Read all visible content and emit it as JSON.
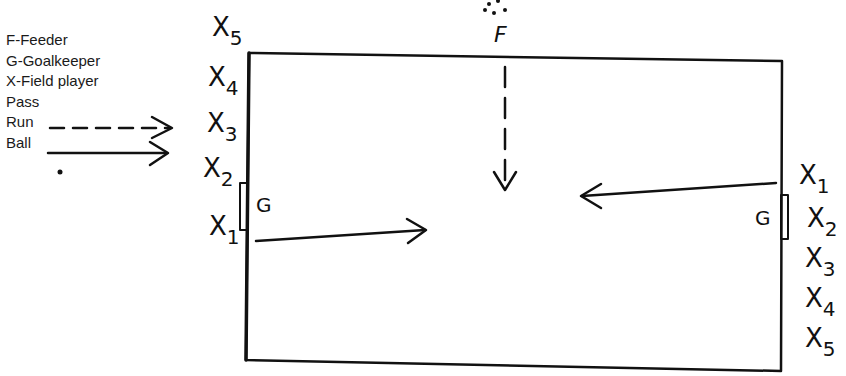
{
  "legend": {
    "feeder": "F-Feeder",
    "goalkeeper": "G-Goalkeeper",
    "field_player": "X-Field player",
    "pass": "Pass",
    "run": "Run",
    "ball": "Ball"
  },
  "feeder_label": "F",
  "goalkeeper_label": "G",
  "left_team": [
    {
      "x": "X",
      "n": "5"
    },
    {
      "x": "X",
      "n": "4"
    },
    {
      "x": "X",
      "n": "3"
    },
    {
      "x": "X",
      "n": "2"
    },
    {
      "x": "X",
      "n": "1"
    }
  ],
  "right_team": [
    {
      "x": "X",
      "n": "1"
    },
    {
      "x": "X",
      "n": "2"
    },
    {
      "x": "X",
      "n": "3"
    },
    {
      "x": "X",
      "n": "4"
    },
    {
      "x": "X",
      "n": "5"
    }
  ],
  "colors": {
    "ink": "#111111",
    "background": "#ffffff"
  }
}
